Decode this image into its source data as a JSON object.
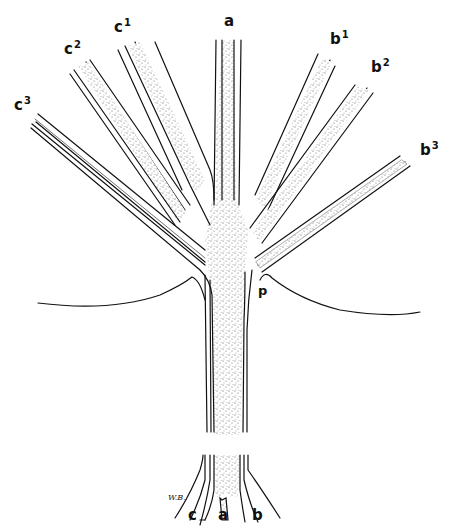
{
  "figure": {
    "colors": {
      "ink": "#111111",
      "stipple": "#555555",
      "background": "#ffffff"
    },
    "top_labels": [
      {
        "id": "c3",
        "base": "c",
        "sup": "3"
      },
      {
        "id": "c2",
        "base": "c",
        "sup": "2"
      },
      {
        "id": "c1",
        "base": "c",
        "sup": "1"
      },
      {
        "id": "a",
        "base": "a",
        "sup": ""
      },
      {
        "id": "b1",
        "base": "b",
        "sup": "1"
      },
      {
        "id": "b2",
        "base": "b",
        "sup": "2"
      },
      {
        "id": "b3",
        "base": "b",
        "sup": "3"
      }
    ],
    "point_label": "p",
    "bottom_labels": [
      "c",
      "a",
      "b"
    ],
    "signature": "W.B."
  }
}
